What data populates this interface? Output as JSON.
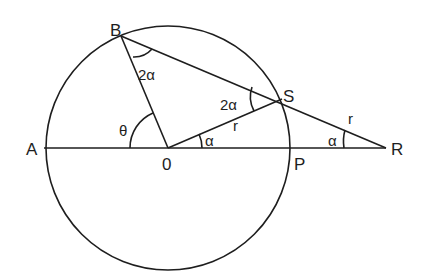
{
  "diagram": {
    "title": "",
    "points": {
      "A": "A",
      "B": "B",
      "O": "0",
      "S": "S",
      "P": "P",
      "R": "R"
    },
    "angles": {
      "theta": "θ",
      "at_B": "2α",
      "at_S": "2α",
      "at_O": "α",
      "at_R": "α"
    },
    "lengths": {
      "OS": "r",
      "SR": "r"
    },
    "colors": {
      "stroke": "#1e1e1e",
      "background": "#ffffff"
    }
  }
}
